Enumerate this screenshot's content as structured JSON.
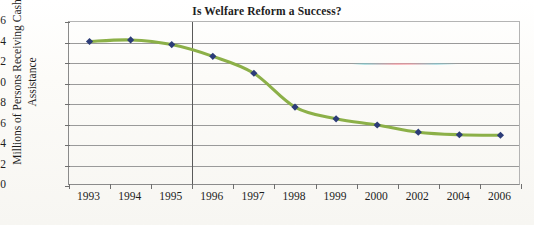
{
  "chart_data": {
    "type": "line",
    "title": "Is Welfare Reform a Success?",
    "xlabel": "",
    "ylabel_line1": "Millions of Persons Receiving Cash",
    "ylabel_line2": "Assistance",
    "ylabel": "Millions of Persons Receiving Cash Assistance",
    "categories": [
      "1993",
      "1994",
      "1995",
      "1996",
      "1997",
      "1998",
      "1999",
      "2000",
      "2002",
      "2004",
      "2006"
    ],
    "values": [
      14.1,
      14.25,
      13.8,
      12.65,
      11.0,
      7.7,
      6.55,
      5.95,
      5.25,
      5.0,
      4.95
    ],
    "series": [
      {
        "name": "Persons Receiving Cash Assistance",
        "values": [
          14.1,
          14.25,
          13.8,
          12.65,
          11.0,
          7.7,
          6.55,
          5.95,
          5.25,
          5.0,
          4.95
        ]
      }
    ],
    "ylim": [
      0,
      16
    ],
    "yticks": [
      0,
      2,
      4,
      6,
      8,
      10,
      12,
      14,
      16
    ],
    "ytick_labels": [
      "0",
      "2",
      "4",
      "6",
      "8",
      "10",
      "12",
      "14",
      "16"
    ],
    "grid": true,
    "grid_axis": "y",
    "legend": false,
    "legend_position": "none",
    "annotations": [
      {
        "name": "reform-year-divider",
        "type": "vertical-line",
        "between": [
          "1995",
          "1996"
        ],
        "label": ""
      }
    ],
    "line_color": "#8cb048",
    "marker_color": "#2c3c78",
    "marker_shape": "diamond",
    "gridline_color": "#9a9a9a",
    "axis_color": "#8b8b8b",
    "background_color": "#fbfaf7"
  }
}
